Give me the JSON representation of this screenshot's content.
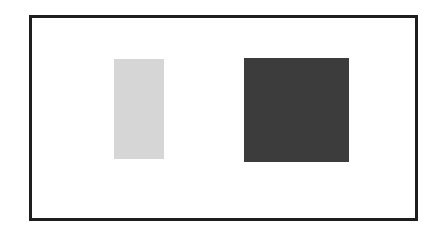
{
  "diagram": {
    "frame": {
      "border_color": "#1e1e1e",
      "background": "#ffffff"
    },
    "shapes": [
      {
        "name": "light-rectangle",
        "type": "rectangle",
        "fill": "#d6d6d6",
        "x": 114,
        "y": 59,
        "width": 50,
        "height": 100
      },
      {
        "name": "dark-square",
        "type": "square",
        "fill": "#3c3c3c",
        "x": 244,
        "y": 58,
        "width": 105,
        "height": 104
      }
    ]
  }
}
